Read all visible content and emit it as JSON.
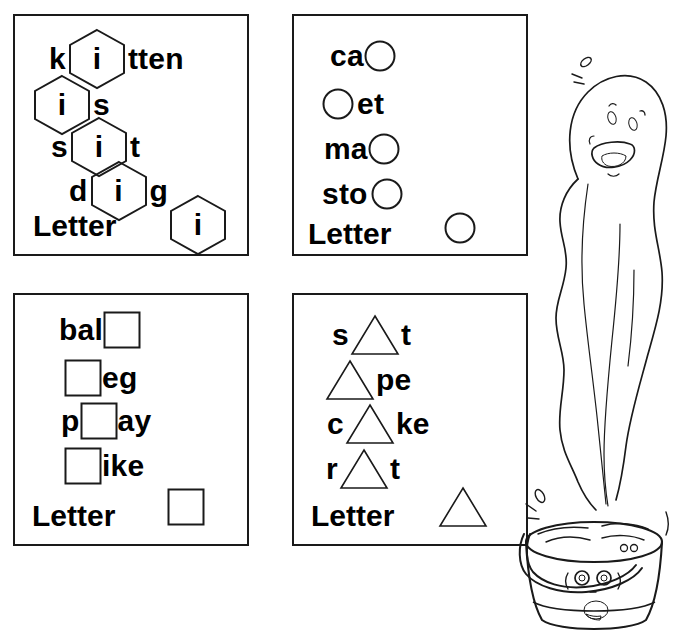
{
  "worksheet": {
    "title": "Short vowel shape worksheet",
    "ink_color": "#1a1a1a",
    "paper_color": "#ffffff"
  },
  "panels": [
    {
      "id": "hexagon",
      "shape": "hexagon",
      "shape_icon": "hexagon-icon",
      "letter_label": "Letter",
      "answer_letter": "i",
      "rows": [
        {
          "before": "k",
          "inside": "i",
          "after": "tten"
        },
        {
          "before": "",
          "inside": "i",
          "after": "s"
        },
        {
          "before": "s",
          "inside": "i",
          "after": "t"
        },
        {
          "before": "d",
          "inside": "i",
          "after": "g"
        }
      ]
    },
    {
      "id": "circle",
      "shape": "circle",
      "shape_icon": "circle-icon",
      "letter_label": "Letter",
      "answer_letter": "",
      "rows": [
        {
          "before": "ca",
          "inside": "",
          "after": ""
        },
        {
          "before": "",
          "inside": "",
          "after": "et"
        },
        {
          "before": "ma",
          "inside": "",
          "after": ""
        },
        {
          "before": "sto",
          "inside": "",
          "after": ""
        }
      ]
    },
    {
      "id": "square",
      "shape": "square",
      "shape_icon": "square-icon",
      "letter_label": "Letter",
      "answer_letter": "",
      "rows": [
        {
          "before": "bal",
          "inside": "",
          "after": ""
        },
        {
          "before": "",
          "inside": "",
          "after": "eg"
        },
        {
          "before": "p",
          "inside": "",
          "after": "ay"
        },
        {
          "before": "",
          "inside": "",
          "after": "ike"
        }
      ]
    },
    {
      "id": "triangle",
      "shape": "triangle",
      "shape_icon": "triangle-icon",
      "letter_label": "Letter",
      "answer_letter": "",
      "rows": [
        {
          "before": "s",
          "inside": "",
          "after": "t"
        },
        {
          "before": "",
          "inside": "",
          "after": "pe"
        },
        {
          "before": "c",
          "inside": "",
          "after": "ke"
        },
        {
          "before": "r",
          "inside": "",
          "after": "t"
        }
      ]
    }
  ],
  "illustration": {
    "name": "steam-ghost-and-bucket",
    "parts": [
      {
        "name": "steam-ghost",
        "description": "smiling steam figure rising from bucket"
      },
      {
        "name": "bucket",
        "description": "bucket of hot water with a face and handle"
      }
    ]
  }
}
